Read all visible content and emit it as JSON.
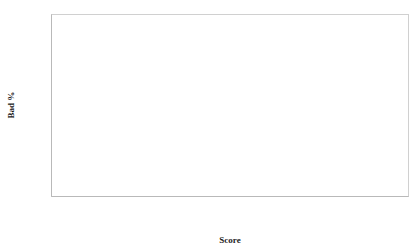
{
  "chart_data": {
    "type": "line",
    "title": "",
    "xlabel": "Score",
    "ylabel": "Bad %",
    "xlim": [
      80,
      195
    ],
    "ylim": [
      0,
      0.35
    ],
    "grid": true,
    "grid_axis": "y",
    "legend": "inline-annotations",
    "x_tick_labels": [
      "80",
      "90",
      "100",
      "110",
      "120",
      "130",
      "140",
      "150",
      "160",
      "170",
      "180",
      "190"
    ],
    "y_tick_labels": [
      "0",
      "0.05",
      "0.1",
      "0.15",
      "0.2",
      "0.25",
      "0.3",
      "0.35"
    ],
    "x": [
      83,
      90,
      100,
      110,
      120,
      130,
      140,
      150,
      160,
      170,
      180,
      190,
      195
    ],
    "series": [
      {
        "name": "Recession",
        "color": "#3a3a3a",
        "values": [
          0.35,
          0.314,
          0.268,
          0.228,
          0.193,
          0.161,
          0.132,
          0.107,
          0.085,
          0.064,
          0.045,
          0.024,
          0.013
        ],
        "annotation": {
          "text": "Recession",
          "x": 133,
          "y": 0.247
        }
      },
      {
        "name": "Benign",
        "color": "#d2d2d2",
        "values": [
          0.207,
          0.172,
          0.133,
          0.102,
          0.079,
          0.062,
          0.049,
          0.04,
          0.032,
          0.026,
          0.02,
          0.012,
          0.008
        ],
        "annotation": {
          "text": "Benign",
          "x": 110,
          "y": 0.063
        }
      }
    ]
  },
  "axis": {
    "y_title": "Bad %",
    "x_title": "Score"
  },
  "annotations": {
    "recession_label": "Recession",
    "benign_label": "Benign"
  },
  "ticks": {
    "y": [
      "0.35",
      "0.3",
      "0.25",
      "0.2",
      "0.15",
      "0.1",
      "0.05",
      "0"
    ],
    "x": [
      "80",
      "90",
      "100",
      "110",
      "120",
      "130",
      "140",
      "150",
      "160",
      "170",
      "180",
      "190"
    ]
  },
  "colors": {
    "recession_line": "#3a3a3a",
    "benign_line": "#d2d2d2",
    "grid": "#d9d9d9",
    "frame": "#d0d0d0",
    "text": "#3a3a3a",
    "background": "#ffffff"
  }
}
